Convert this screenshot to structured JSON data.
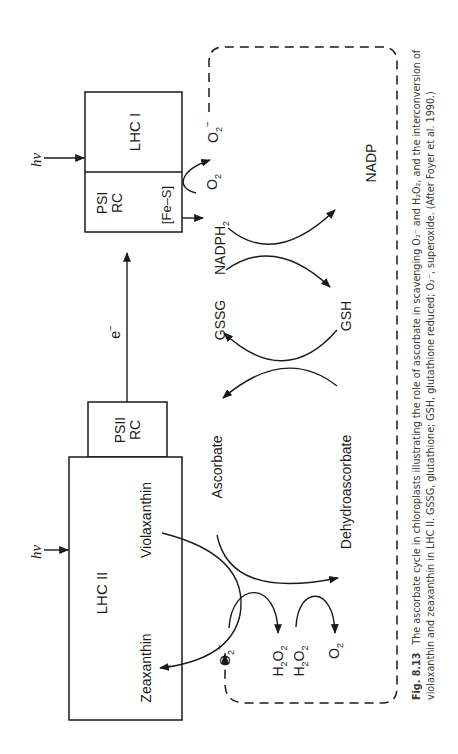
{
  "figure": {
    "boxes": {
      "psi_rc": {
        "line1": "PSI",
        "line2": "RC",
        "fes": "[Fe–S]"
      },
      "lhc_i": {
        "label": "LHC I"
      },
      "psii_rc": {
        "line1": "PSII",
        "line2": "RC"
      },
      "lhc_ii": {
        "label": "LHC II",
        "violaxanthin": "Violaxanthin",
        "zeaxanthin": "Zeaxanthin"
      }
    },
    "light": {
      "top": "hν",
      "bottom": "hν"
    },
    "electron": {
      "label": "e",
      "sup": "−"
    },
    "cycle_labels": {
      "nadph2": "NADPH",
      "nadph2_sub": "2",
      "nadp": "NADP",
      "gssg": "GSSG",
      "gsh": "GSH",
      "ascorbate": "Ascorbate",
      "dehydroascorbate": "Dehydroascorbate"
    },
    "species": {
      "o2_top": "O",
      "o2_top_sub": "2",
      "o2_minus_top": "O",
      "o2_minus_top_sub": "2",
      "o2_minus_top_sup": "−",
      "o2_minus_bottom": "O",
      "o2_minus_bottom_sub": "2",
      "o2_minus_bottom_sup": "−",
      "h2o2_a": "H",
      "h2o2_b": "H",
      "h2o2_mid": "O",
      "two": "2",
      "o2_bottom": "O",
      "o2_bottom_sub": "2"
    }
  },
  "caption": {
    "fig_number": "Fig. 8.13",
    "line1": "The ascorbate cycle in chloroplasts illustrating the role of ascorbate in scavenging O₂⁻ and H₂O₂, and the interconversion of",
    "line2": "violaxanthin and zeaxanthin in LHC II. GSSG, glutathione; GSH, glutathione reduced; O₂⁻, superoxide. (After Foyer et al. 1990.)"
  }
}
